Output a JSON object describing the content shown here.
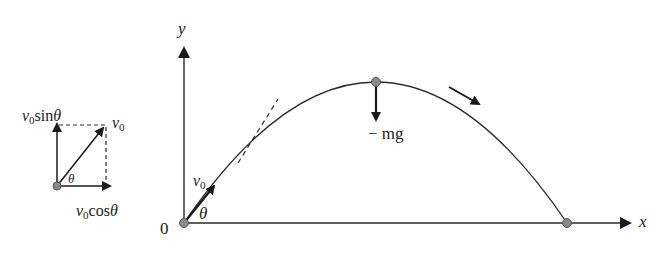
{
  "diagram": {
    "axes": {
      "x_label": "x",
      "y_label": "y",
      "origin_label": "0"
    },
    "launch": {
      "velocity_label": "v",
      "velocity_sub": "0",
      "angle_label": "θ"
    },
    "apex": {
      "force_label": "− mg"
    },
    "decomposition": {
      "vertical_label": "v",
      "vertical_sub": "0",
      "vertical_fn": "sin",
      "vertical_angle": "θ",
      "resultant_label": "v",
      "resultant_sub": "0",
      "horizontal_label": "v",
      "horizontal_sub": "0",
      "horizontal_fn": "cos",
      "horizontal_angle": "θ",
      "angle_label": "θ"
    },
    "colors": {
      "line": "#2a2a2a",
      "ball_fill": "#8a8a8a",
      "ball_stroke": "#555555"
    }
  }
}
